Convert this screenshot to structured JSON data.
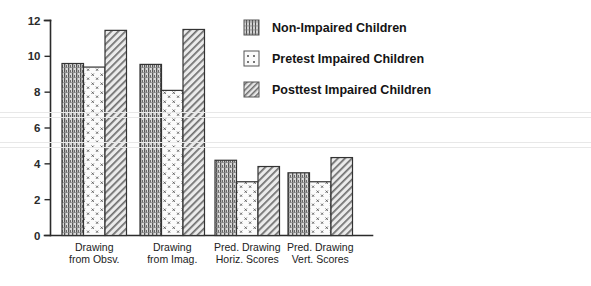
{
  "chart_data": {
    "type": "bar",
    "title": "",
    "subtitle": "",
    "xlabel": "",
    "ylabel": "",
    "ylim": [
      0,
      12
    ],
    "yticks": [
      0,
      2,
      4,
      6,
      8,
      10,
      12
    ],
    "ytick_labels": [
      "0",
      "2",
      "4",
      "6",
      "8",
      "10",
      "12"
    ],
    "grid": false,
    "legend_position": "right-top",
    "categories": [
      "Drawing from Obsv.",
      "Drawing from Imag.",
      "Pred. Drawing Horiz. Scores",
      "Pred. Drawing Vert. Scores"
    ],
    "category_lines": [
      [
        "Drawing",
        "from Obsv."
      ],
      [
        "Drawing",
        "from Imag."
      ],
      [
        "Pred. Drawing",
        "Horiz. Scores"
      ],
      [
        "Pred. Drawing",
        "Vert. Scores"
      ]
    ],
    "series": [
      {
        "name": "Non-Impaired Children",
        "pattern": "vertical-dense-hatch",
        "values": [
          9.6,
          9.55,
          4.2,
          3.5
        ]
      },
      {
        "name": "Pretest Impaired Children",
        "pattern": "sparse-dot-cross",
        "values": [
          9.4,
          8.1,
          3.0,
          3.0
        ]
      },
      {
        "name": "Posttest Impaired Children",
        "pattern": "diagonal-hatch",
        "values": [
          11.45,
          11.5,
          3.85,
          4.35
        ]
      }
    ]
  },
  "legend": {
    "items": [
      {
        "label": "Non-Impaired Children",
        "swatch": "vertical-dense-hatch"
      },
      {
        "label": "Pretest Impaired Children",
        "swatch": "sparse-dot-cross"
      },
      {
        "label": "Posttest Impaired Children",
        "swatch": "diagonal-hatch"
      }
    ]
  },
  "colors": {
    "background": "#ffffff",
    "axis": "#2b2b2b",
    "text": "#1d1d1d",
    "bar_outline": "#333333",
    "pattern_ink": "#4a4a4a",
    "scan_line": "#e8e8e8"
  }
}
